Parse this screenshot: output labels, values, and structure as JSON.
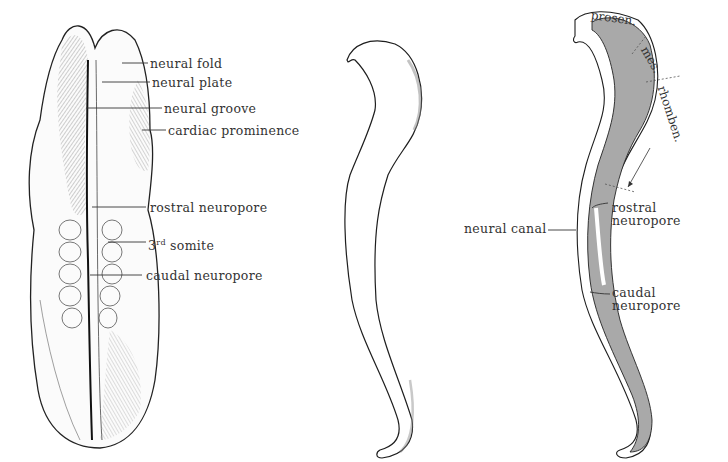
{
  "figure": {
    "panels": [
      {
        "id": "dorsal-view",
        "labels": {
          "neural_fold": "neural fold",
          "neural_plate": "neural plate",
          "neural_groove": "neural groove",
          "cardiac_prominence": "cardiac prominence",
          "rostral_neuropore": "rostral neuropore",
          "somite_num": "3",
          "somite_sup": "rd",
          "somite_text": " somite",
          "caudal_neuropore": "caudal neuropore"
        }
      },
      {
        "id": "lateral-outline",
        "labels": {}
      },
      {
        "id": "sagittal-section",
        "labels": {
          "prosen": "prosen.",
          "mes": "mes.",
          "rhomben": "rhomben.",
          "neural_canal": "neural canal",
          "rostral": "rostral",
          "rostral_neuropore": "neuropore",
          "caudal": "caudal",
          "caudal_neuropore": "neuropore"
        }
      }
    ],
    "colors": {
      "ink": "#1e1e1e",
      "section_fill": "#a9a9a9",
      "background": "#ffffff"
    }
  }
}
